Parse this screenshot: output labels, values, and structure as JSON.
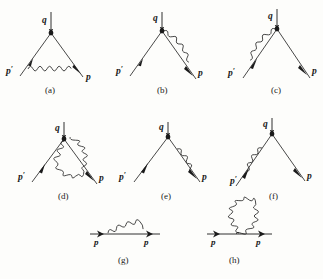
{
  "figure": {
    "background_color": "#fdfdfb",
    "ink_color": "#1a1a1a",
    "columns": 3,
    "rows": 3
  },
  "diagrams": [
    {
      "id": "a",
      "caption": "(a)",
      "type": "vertex-correction",
      "description": "photon exchanged between incoming and outgoing fermion legs below the vertex",
      "labels": {
        "incoming": "p",
        "incoming_prime": "′",
        "outgoing": "p",
        "boson": "q"
      },
      "label_q": "q",
      "label_p_prime": "p",
      "label_p": "p",
      "photon_path": "arc-below-vertex"
    },
    {
      "id": "b",
      "caption": "(b)",
      "type": "vertex-correction-right",
      "description": "photon from vertex curving down onto the right outgoing leg",
      "label_q": "q",
      "label_p_prime": "p",
      "label_p": "p",
      "photon_path": "right-leg-arc"
    },
    {
      "id": "c",
      "caption": "(c)",
      "type": "vertex-correction-left",
      "description": "photon from vertex curving down onto the left incoming leg",
      "label_q": "q",
      "label_p_prime": "p",
      "label_p": "p",
      "photon_path": "left-leg-arc"
    },
    {
      "id": "d",
      "caption": "(d)",
      "type": "vertex-photon-loop",
      "description": "closed photon loop hanging below the interaction vertex",
      "label_q": "q",
      "label_p_prime": "p",
      "label_p": "p",
      "photon_path": "closed-loop-below-vertex"
    },
    {
      "id": "e",
      "caption": "(e)",
      "type": "self-energy-right-leg",
      "description": "photon self-energy loop on the right outgoing fermion leg",
      "label_q": "q",
      "label_p_prime": "p",
      "label_p": "p",
      "photon_path": "right-leg-self-energy"
    },
    {
      "id": "f",
      "caption": "(f)",
      "type": "self-energy-left-leg",
      "description": "photon self-energy loop on the left incoming fermion leg",
      "label_q": "q",
      "label_p_prime": "p",
      "label_p": "p",
      "photon_path": "left-leg-self-energy"
    },
    {
      "id": "g",
      "caption": "(g)",
      "type": "propagator-self-energy",
      "description": "fermion propagator with photon self-energy arc above the line",
      "label_p_left": "p",
      "label_p_right": "p",
      "photon_path": "arc-above-line"
    },
    {
      "id": "h",
      "caption": "(h)",
      "type": "propagator-tadpole",
      "description": "fermion propagator with closed photon tadpole loop attached at one point",
      "label_p_left": "p",
      "label_p_right": "p",
      "photon_path": "closed-loop-above-line"
    }
  ],
  "prime_mark": "′"
}
